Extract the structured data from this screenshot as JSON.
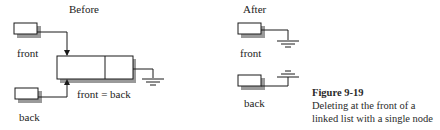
{
  "before": {
    "title": "Before",
    "front_label": "front",
    "back_label": "back",
    "equality_label": "front = back"
  },
  "after": {
    "title": "After",
    "front_label": "front",
    "back_label": "back"
  },
  "caption": {
    "figure_number": "Figure 9-19",
    "line1": "Deleting at the front of a",
    "line2": "linked list with a single node"
  },
  "colors": {
    "stroke": "#1a1a1a",
    "shadow": "#9a9a9a",
    "background": "#ffffff"
  }
}
